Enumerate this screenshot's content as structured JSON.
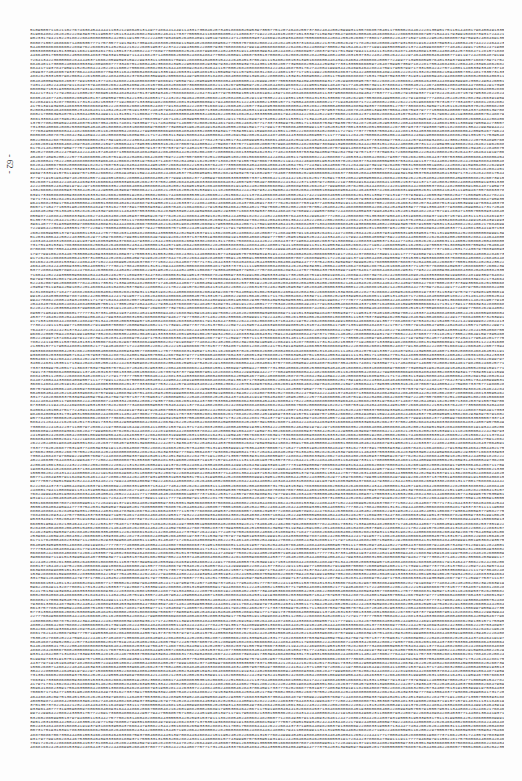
{
  "page": {
    "number_label": "- 62 -",
    "content_type": "dense block of decimal digits",
    "first_line_prefix": "5109505711621102767463845444441103212986451314977486441449114331735",
    "line_count": 171,
    "chars_per_line": 182,
    "ink_color": "#3a3a3a",
    "paper_color": "#fdfdfd"
  }
}
